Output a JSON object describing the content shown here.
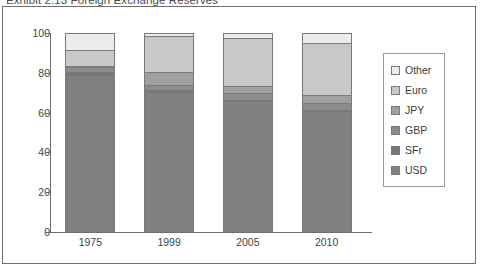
{
  "caption": "Exhibit 2.13   Foreign Exchange Reserves",
  "chart_data": {
    "type": "bar",
    "subtype": "stacked-bar-100",
    "title": "Exhibit 2.13   Foreign Exchange Reserves",
    "xlabel": "",
    "ylabel": "",
    "ylim": [
      0,
      100
    ],
    "yticks": [
      0,
      20,
      40,
      60,
      80,
      100
    ],
    "grid": false,
    "legend_position": "right",
    "categories": [
      "1975",
      "1999",
      "2005",
      "2010"
    ],
    "series": [
      {
        "name": "USD",
        "color": "#808080",
        "values": [
          79.4,
          71.0,
          66.5,
          61.5
        ]
      },
      {
        "name": "SFr",
        "color": "#767676",
        "values": [
          1.6,
          0.7,
          0.2,
          0.1
        ]
      },
      {
        "name": "GBP",
        "color": "#8c8c8c",
        "values": [
          2.5,
          2.9,
          3.6,
          3.9
        ]
      },
      {
        "name": "JPY",
        "color": "#a0a0a0",
        "values": [
          0.5,
          6.4,
          3.6,
          3.8
        ]
      },
      {
        "name": "Euro",
        "color": "#c8c8c8",
        "values": [
          8.0,
          17.9,
          24.1,
          26.2
        ]
      },
      {
        "name": "Other",
        "color": "#ececec",
        "values": [
          8.0,
          1.1,
          2.0,
          4.5
        ]
      }
    ]
  },
  "legend": {
    "items": [
      {
        "label": "Other",
        "color": "#ececec"
      },
      {
        "label": "Euro",
        "color": "#c8c8c8"
      },
      {
        "label": "JPY",
        "color": "#a0a0a0"
      },
      {
        "label": "GBP",
        "color": "#8c8c8c"
      },
      {
        "label": "SFr",
        "color": "#767676"
      },
      {
        "label": "USD",
        "color": "#808080"
      }
    ]
  },
  "axis": {
    "y_tick_labels": [
      "100",
      "80",
      "60",
      "40",
      "20",
      "0"
    ],
    "x_tick_labels": [
      "1975",
      "1999",
      "2005",
      "2010"
    ]
  }
}
